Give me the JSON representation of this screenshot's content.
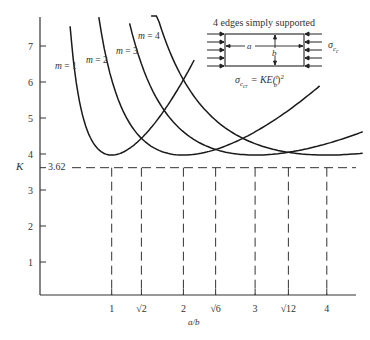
{
  "chart_data": {
    "type": "line",
    "title": "",
    "xlabel": "a/b",
    "ylabel": "K",
    "xlim": [
      0,
      4.6
    ],
    "ylim": [
      0,
      7.5
    ],
    "grid": false,
    "formula": "K = (m/(a/b) + (a/b)/m)^2",
    "y_ticks": [
      1,
      2,
      3,
      4,
      5,
      6,
      7
    ],
    "y_tick_labels": [
      "1",
      "2",
      "3",
      "4",
      "5",
      "6",
      "7"
    ],
    "x_ticks": [
      1,
      1.4142,
      2,
      2.4495,
      3,
      3.4641,
      4
    ],
    "x_tick_labels": [
      "1",
      "√2",
      "2",
      "√6",
      "3",
      "√12",
      "4"
    ],
    "min_line": {
      "value": 3.62,
      "label": "3.62",
      "style": "dashed"
    },
    "vertical_dashed_at": [
      1,
      1.4142,
      2,
      2.4495,
      3,
      3.4641,
      4
    ],
    "series": [
      {
        "name": "m = 1",
        "m": 1,
        "x_range": [
          0.42,
          2.15
        ],
        "x": [
          0.42,
          0.6,
          0.8,
          1.0,
          1.2,
          1.4142,
          1.6,
          1.8,
          2.0,
          2.15
        ],
        "values": [
          6.25,
          4.67,
          4.1,
          3.62,
          3.7,
          4.06,
          4.4,
          4.9,
          5.4,
          5.8
        ]
      },
      {
        "name": "m = 2",
        "m": 2,
        "x_range": [
          0.82,
          3.9
        ],
        "x": [
          0.82,
          1.0,
          1.4142,
          2.0,
          2.4495,
          3.0,
          3.5,
          3.9
        ],
        "values": [
          6.4,
          5.4,
          4.06,
          3.62,
          3.75,
          4.1,
          4.6,
          5.2
        ]
      },
      {
        "name": "m = 3",
        "m": 3,
        "x_range": [
          1.25,
          4.5
        ],
        "x": [
          1.25,
          1.6,
          2.0,
          2.4495,
          3.0,
          3.4641,
          4.0,
          4.5
        ],
        "values": [
          6.6,
          5.3,
          4.4,
          3.9,
          3.62,
          3.67,
          3.9,
          4.2
        ]
      },
      {
        "name": "m = 4",
        "m": 4,
        "x_range": [
          1.55,
          4.5
        ],
        "x": [
          1.55,
          2.0,
          2.4495,
          3.0,
          3.4641,
          4.0,
          4.5
        ],
        "values": [
          7.0,
          5.4,
          4.5,
          4.0,
          3.75,
          3.62,
          3.7
        ]
      }
    ],
    "annotations": [
      {
        "text": "4 edges simply supported"
      },
      {
        "text": "σ_cc",
        "role": "applied compressive stress"
      },
      {
        "text": "σ_ccr = KE(t/b)²",
        "role": "critical buckling stress formula"
      },
      {
        "text": "a",
        "role": "plate length"
      },
      {
        "text": "b",
        "role": "plate width"
      }
    ]
  },
  "labels": {
    "ylabel": "K",
    "xlabel": "a/b",
    "min_value": "3.62",
    "inset_title": "4 edges simply supported",
    "inset_a": "a",
    "inset_b": "b",
    "stress_symbol": "σ",
    "stress_sub": "c",
    "stress_subsub": "c",
    "formula_lhs_sub": "c",
    "formula_lhs_subsub": "cr",
    "formula_rhs": "= KE(",
    "formula_t": "t",
    "formula_b": "b",
    "formula_tail": ")",
    "formula_exp": "2",
    "series_labels": [
      "m = 1",
      "m = 2",
      "m = 3",
      "m = 4"
    ],
    "m_var": "m",
    "m_values": [
      "= 1",
      "= 2",
      "= 3",
      "= 4"
    ]
  },
  "colors": {
    "line": "#1a1a1a",
    "axis": "#333333",
    "text": "#333333",
    "background": "#ffffff"
  }
}
